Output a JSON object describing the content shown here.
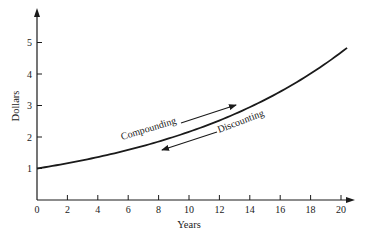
{
  "chart_data": {
    "type": "line",
    "title": "",
    "xlabel": "Years",
    "ylabel": "Dollars",
    "xlim": [
      0,
      20.5
    ],
    "ylim": [
      0,
      5.8
    ],
    "x_ticks": [
      0,
      2,
      4,
      6,
      8,
      10,
      12,
      14,
      16,
      18,
      20
    ],
    "y_ticks": [
      1,
      2,
      3,
      4,
      5
    ],
    "grid": false,
    "legend": null,
    "series": [
      {
        "name": "Future value of $1",
        "x": [
          0,
          2,
          4,
          6,
          8,
          10,
          12,
          14,
          16,
          18,
          20,
          20.4
        ],
        "values": [
          1.0,
          1.17,
          1.36,
          1.59,
          1.85,
          2.16,
          2.52,
          2.94,
          3.43,
          4.0,
          4.66,
          4.83
        ]
      }
    ],
    "annotations": [
      {
        "text": "Compounding",
        "arrow_direction": "forward (toward later years)"
      },
      {
        "text": "Discounting",
        "arrow_direction": "backward (toward earlier years)"
      }
    ]
  },
  "labels": {
    "xlabel": "Years",
    "ylabel": "Dollars",
    "compounding": "Compounding",
    "discounting": "Discounting",
    "x_ticks": [
      "0",
      "2",
      "4",
      "6",
      "8",
      "10",
      "12",
      "14",
      "16",
      "18",
      "20"
    ],
    "y_ticks": [
      "1",
      "2",
      "3",
      "4",
      "5"
    ]
  },
  "colors": {
    "line": "#1a1a1a",
    "axis": "#1a1a1a",
    "background": "#ffffff"
  }
}
